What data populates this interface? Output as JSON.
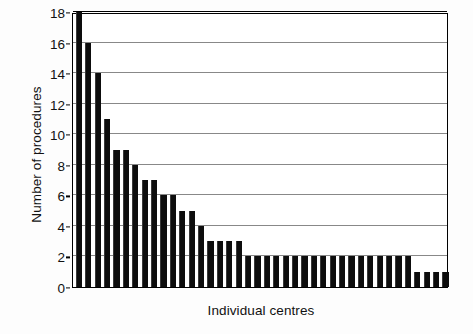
{
  "chart_data": {
    "type": "bar",
    "title": "",
    "xlabel": "Individual centres",
    "ylabel": "Number of procedures",
    "ylim": [
      0,
      18
    ],
    "ytick_labels": [
      "0",
      "2",
      "4",
      "6",
      "8",
      "10",
      "12",
      "14",
      "16",
      "18"
    ],
    "ytick_values": [
      0,
      2,
      4,
      6,
      8,
      10,
      12,
      14,
      16,
      18
    ],
    "grid": true,
    "legend": "none",
    "categories": [
      "1",
      "2",
      "3",
      "4",
      "5",
      "6",
      "7",
      "8",
      "9",
      "10",
      "11",
      "12",
      "13",
      "14",
      "15",
      "16",
      "17",
      "18",
      "19",
      "20",
      "21",
      "22",
      "23",
      "24",
      "25",
      "26",
      "27",
      "28",
      "29",
      "30",
      "31",
      "32",
      "33",
      "34",
      "35",
      "36",
      "37",
      "38",
      "39",
      "40"
    ],
    "values": [
      18,
      16,
      14,
      11,
      9,
      9,
      8,
      7,
      7,
      6,
      6,
      5,
      5,
      4,
      3,
      3,
      3,
      3,
      2,
      2,
      2,
      2,
      2,
      2,
      2,
      2,
      2,
      2,
      2,
      2,
      2,
      2,
      2,
      2,
      2,
      2,
      1,
      1,
      1,
      1
    ],
    "bar_color": "#0d0d0d",
    "axis_color": "#000000",
    "grid_color": "#888888",
    "background": "#ffffff"
  }
}
